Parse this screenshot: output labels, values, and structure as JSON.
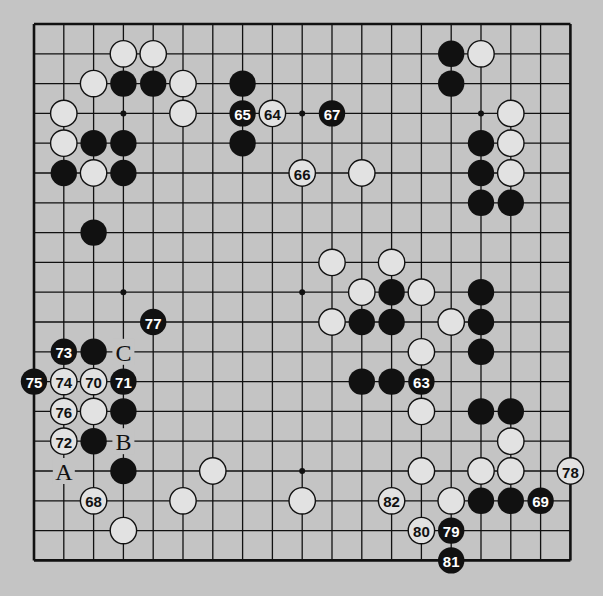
{
  "diagram": {
    "type": "go-board-partial",
    "grid": {
      "cols": 19,
      "rows": 19,
      "origin_x": 34,
      "origin_y": 24,
      "spacing": 29.8,
      "visible_cols": [
        0,
        18
      ],
      "visible_rows": [
        0,
        18
      ]
    },
    "star_points": [
      [
        3,
        3
      ],
      [
        3,
        9
      ],
      [
        3,
        15
      ],
      [
        9,
        3
      ],
      [
        9,
        9
      ],
      [
        9,
        15
      ],
      [
        15,
        3
      ],
      [
        15,
        9
      ],
      [
        15,
        15
      ]
    ],
    "colors": {
      "background": "#c4c4c4",
      "black": "#111111",
      "white": "#e2e2e2",
      "line": "#111111"
    },
    "stones": [
      {
        "c": 3,
        "r": 1,
        "color": "white"
      },
      {
        "c": 4,
        "r": 1,
        "color": "white"
      },
      {
        "c": 2,
        "r": 2,
        "color": "white"
      },
      {
        "c": 3,
        "r": 2,
        "color": "black"
      },
      {
        "c": 4,
        "r": 2,
        "color": "black"
      },
      {
        "c": 5,
        "r": 2,
        "color": "white"
      },
      {
        "c": 7,
        "r": 2,
        "color": "black"
      },
      {
        "c": 1,
        "r": 3,
        "color": "white"
      },
      {
        "c": 5,
        "r": 3,
        "color": "white"
      },
      {
        "c": 1,
        "r": 4,
        "color": "white"
      },
      {
        "c": 2,
        "r": 4,
        "color": "black"
      },
      {
        "c": 3,
        "r": 4,
        "color": "black"
      },
      {
        "c": 7,
        "r": 4,
        "color": "black"
      },
      {
        "c": 1,
        "r": 5,
        "color": "black"
      },
      {
        "c": 2,
        "r": 5,
        "color": "white"
      },
      {
        "c": 3,
        "r": 5,
        "color": "black"
      },
      {
        "c": 2,
        "r": 7,
        "color": "black"
      },
      {
        "c": 14,
        "r": 1,
        "color": "black"
      },
      {
        "c": 15,
        "r": 1,
        "color": "white"
      },
      {
        "c": 14,
        "r": 2,
        "color": "black"
      },
      {
        "c": 16,
        "r": 3,
        "color": "white"
      },
      {
        "c": 15,
        "r": 4,
        "color": "black"
      },
      {
        "c": 16,
        "r": 4,
        "color": "white"
      },
      {
        "c": 11,
        "r": 5,
        "color": "white"
      },
      {
        "c": 15,
        "r": 5,
        "color": "black"
      },
      {
        "c": 16,
        "r": 5,
        "color": "white"
      },
      {
        "c": 15,
        "r": 6,
        "color": "black"
      },
      {
        "c": 16,
        "r": 6,
        "color": "black"
      },
      {
        "c": 10,
        "r": 8,
        "color": "white"
      },
      {
        "c": 12,
        "r": 8,
        "color": "white"
      },
      {
        "c": 11,
        "r": 9,
        "color": "white"
      },
      {
        "c": 12,
        "r": 9,
        "color": "black"
      },
      {
        "c": 13,
        "r": 9,
        "color": "white"
      },
      {
        "c": 15,
        "r": 9,
        "color": "black"
      },
      {
        "c": 10,
        "r": 10,
        "color": "white"
      },
      {
        "c": 11,
        "r": 10,
        "color": "black"
      },
      {
        "c": 12,
        "r": 10,
        "color": "black"
      },
      {
        "c": 14,
        "r": 10,
        "color": "white"
      },
      {
        "c": 15,
        "r": 10,
        "color": "black"
      },
      {
        "c": 13,
        "r": 11,
        "color": "white"
      },
      {
        "c": 15,
        "r": 11,
        "color": "black"
      },
      {
        "c": 11,
        "r": 12,
        "color": "black"
      },
      {
        "c": 12,
        "r": 12,
        "color": "black"
      },
      {
        "c": 13,
        "r": 13,
        "color": "white"
      },
      {
        "c": 15,
        "r": 13,
        "color": "black"
      },
      {
        "c": 16,
        "r": 13,
        "color": "black"
      },
      {
        "c": 16,
        "r": 14,
        "color": "white"
      },
      {
        "c": 13,
        "r": 15,
        "color": "white"
      },
      {
        "c": 15,
        "r": 15,
        "color": "white"
      },
      {
        "c": 16,
        "r": 15,
        "color": "white"
      },
      {
        "c": 9,
        "r": 16,
        "color": "white"
      },
      {
        "c": 14,
        "r": 16,
        "color": "white"
      },
      {
        "c": 15,
        "r": 16,
        "color": "black"
      },
      {
        "c": 16,
        "r": 16,
        "color": "black"
      },
      {
        "c": 2,
        "r": 11,
        "color": "black"
      },
      {
        "c": 2,
        "r": 13,
        "color": "white"
      },
      {
        "c": 3,
        "r": 13,
        "color": "black"
      },
      {
        "c": 2,
        "r": 14,
        "color": "black"
      },
      {
        "c": 3,
        "r": 15,
        "color": "black"
      },
      {
        "c": 6,
        "r": 15,
        "color": "white"
      },
      {
        "c": 5,
        "r": 16,
        "color": "white"
      },
      {
        "c": 3,
        "r": 17,
        "color": "white"
      }
    ],
    "numbered_moves": [
      {
        "n": "63",
        "c": 13,
        "r": 12,
        "color": "black"
      },
      {
        "n": "64",
        "c": 8,
        "r": 3,
        "color": "white"
      },
      {
        "n": "65",
        "c": 7,
        "r": 3,
        "color": "black"
      },
      {
        "n": "66",
        "c": 9,
        "r": 5,
        "color": "white"
      },
      {
        "n": "67",
        "c": 10,
        "r": 3,
        "color": "black"
      },
      {
        "n": "68",
        "c": 2,
        "r": 16,
        "color": "white"
      },
      {
        "n": "69",
        "c": 17,
        "r": 16,
        "color": "black"
      },
      {
        "n": "70",
        "c": 2,
        "r": 12,
        "color": "white"
      },
      {
        "n": "71",
        "c": 3,
        "r": 12,
        "color": "black"
      },
      {
        "n": "72",
        "c": 1,
        "r": 14,
        "color": "white"
      },
      {
        "n": "73",
        "c": 1,
        "r": 11,
        "color": "black"
      },
      {
        "n": "74",
        "c": 1,
        "r": 12,
        "color": "white"
      },
      {
        "n": "75",
        "c": 0,
        "r": 12,
        "color": "black"
      },
      {
        "n": "76",
        "c": 1,
        "r": 13,
        "color": "white"
      },
      {
        "n": "77",
        "c": 4,
        "r": 10,
        "color": "black"
      },
      {
        "n": "78",
        "c": 18,
        "r": 15,
        "color": "white"
      },
      {
        "n": "79",
        "c": 14,
        "r": 17,
        "color": "black"
      },
      {
        "n": "80",
        "c": 13,
        "r": 17,
        "color": "white"
      },
      {
        "n": "81",
        "c": 14,
        "r": 18,
        "color": "black"
      },
      {
        "n": "82",
        "c": 12,
        "r": 16,
        "color": "white"
      }
    ],
    "letter_labels": [
      {
        "text": "A",
        "c": 1,
        "r": 15
      },
      {
        "text": "B",
        "c": 3,
        "r": 14
      },
      {
        "text": "C",
        "c": 3,
        "r": 11
      }
    ]
  }
}
